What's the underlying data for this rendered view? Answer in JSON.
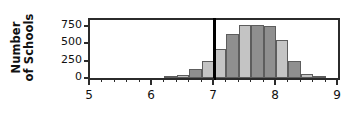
{
  "chart_data": {
    "type": "bar",
    "title": "",
    "subtitle": "",
    "xlabel": "",
    "ylabel": "Number of Schools",
    "ylabel_line1": "Number",
    "ylabel_line2": "of Schools",
    "xlim": [
      5,
      9
    ],
    "ylim": [
      0,
      830
    ],
    "grid": false,
    "legend": "none",
    "bin_width": 0.2,
    "y_ticks": [
      0,
      250,
      500,
      750
    ],
    "y_tick_labels": [
      "0",
      "250",
      "500",
      "750"
    ],
    "x_ticks": [
      5,
      6,
      7,
      8,
      9
    ],
    "x_tick_labels": [
      "5",
      "6",
      "7",
      "8",
      "9"
    ],
    "x_minor_tick_step": 0.2,
    "annotations": [
      {
        "name": "reference-line",
        "type": "vertical-line",
        "x": 7,
        "color": "#000000",
        "label": ""
      }
    ],
    "bin_left_edges": [
      6.2,
      6.4,
      6.6,
      6.8,
      7.0,
      7.2,
      7.4,
      7.6,
      7.8,
      8.0,
      8.2,
      8.4,
      8.6
    ],
    "categories": [
      "6.2-6.4",
      "6.4-6.6",
      "6.6-6.8",
      "6.8-7.0",
      "7.0-7.2",
      "7.2-7.4",
      "7.4-7.6",
      "7.6-7.8",
      "7.8-8.0",
      "8.0-8.2",
      "8.2-8.4",
      "8.4-8.6",
      "8.6-8.8"
    ],
    "values": [
      20,
      50,
      135,
      245,
      420,
      625,
      765,
      760,
      750,
      540,
      250,
      55,
      15
    ],
    "bar_colors": [
      "#8f8f8f",
      "#c4c4c4",
      "#8f8f8f",
      "#c4c4c4",
      "#c4c4c4",
      "#8f8f8f",
      "#c4c4c4",
      "#8f8f8f",
      "#8f8f8f",
      "#c4c4c4",
      "#8f8f8f",
      "#c4c4c4",
      "#8f8f8f"
    ],
    "bar_edge_color": "#5d5d5d",
    "axis_color": "#2b2b2b",
    "background_color": "#ffffff",
    "text_color": "#111111"
  }
}
